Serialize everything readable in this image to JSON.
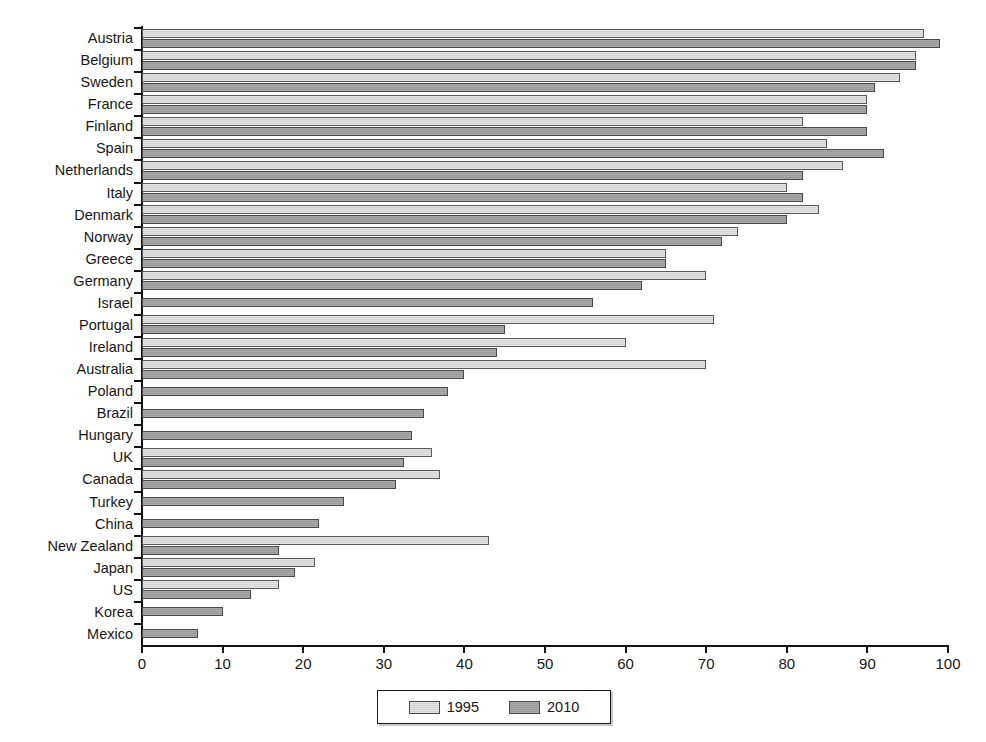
{
  "chart_data": {
    "type": "bar",
    "orientation": "horizontal",
    "title": "",
    "xlabel": "",
    "ylabel": "",
    "xlim": [
      0,
      100
    ],
    "xticks": [
      0,
      10,
      20,
      30,
      40,
      50,
      60,
      70,
      80,
      90,
      100
    ],
    "grid": false,
    "legend_position": "bottom-center",
    "categories": [
      "Austria",
      "Belgium",
      "Sweden",
      "France",
      "Finland",
      "Spain",
      "Netherlands",
      "Italy",
      "Denmark",
      "Norway",
      "Greece",
      "Germany",
      "Israel",
      "Portugal",
      "Ireland",
      "Australia",
      "Poland",
      "Brazil",
      "Hungary",
      "UK",
      "Canada",
      "Turkey",
      "China",
      "New Zealand",
      "Japan",
      "US",
      "Korea",
      "Mexico"
    ],
    "series": [
      {
        "name": "1995",
        "color": "#d9d9d9",
        "values": [
          97,
          96,
          94,
          90,
          82,
          85,
          87,
          80,
          84,
          74,
          65,
          70,
          null,
          71,
          60,
          70,
          null,
          null,
          null,
          36,
          37,
          null,
          null,
          43,
          21.5,
          17,
          null,
          null
        ]
      },
      {
        "name": "2010",
        "color": "#a0a0a0",
        "values": [
          99,
          96,
          91,
          90,
          90,
          92,
          82,
          82,
          80,
          72,
          65,
          62,
          56,
          45,
          44,
          40,
          38,
          35,
          33.5,
          32.5,
          31.5,
          25,
          22,
          17,
          19,
          13.5,
          10,
          7
        ]
      }
    ]
  },
  "legend": {
    "items": [
      {
        "label": "1995",
        "swatch": "light-gray"
      },
      {
        "label": "2010",
        "swatch": "dark-gray"
      }
    ]
  },
  "axis": {
    "x_tick_labels": [
      "0",
      "10",
      "20",
      "30",
      "40",
      "50",
      "60",
      "70",
      "80",
      "90",
      "100"
    ]
  }
}
